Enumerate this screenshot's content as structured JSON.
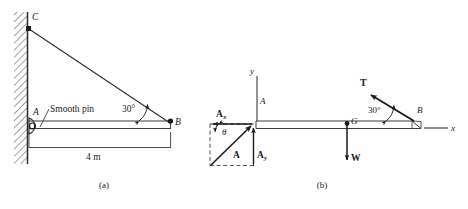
{
  "figure": {
    "title_a": "(a)",
    "title_b": "(b)"
  },
  "diagram_a": {
    "name": "cable-supported-beam-space-diagram",
    "labels": {
      "point_c": "C",
      "point_a": "A",
      "point_b": "B",
      "pin_note": "Smooth pin",
      "angle": "30°",
      "length": "4 m"
    },
    "support": "hatched-wall",
    "pin_symbol": "circle"
  },
  "diagram_b": {
    "name": "free-body-diagram",
    "labels": {
      "axis_y": "y",
      "axis_x": "x",
      "point_a": "A",
      "point_b": "B",
      "point_g": "G",
      "tension": "T",
      "weight": "W",
      "reaction_resultant": "A",
      "reaction_x": "A",
      "reaction_x_sub": "x",
      "reaction_y": "A",
      "reaction_y_sub": "y",
      "angle_theta": "θ",
      "angle_cable": "30°"
    }
  },
  "colors": {
    "ink": "#1a1a1a",
    "line": "#3a3a3a",
    "hatch": "#555555",
    "background": "#ffffff"
  }
}
